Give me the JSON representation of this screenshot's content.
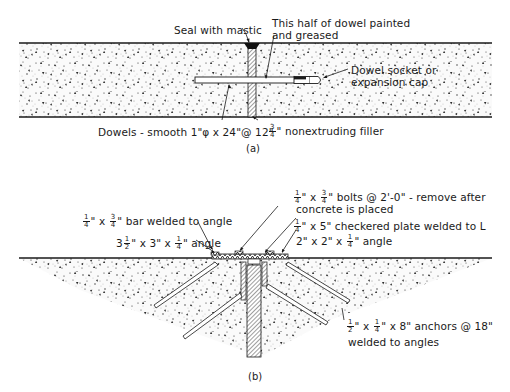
{
  "figure_a": {
    "caption": "(a)",
    "labels": {
      "seal": "Seal with mastic",
      "dowel_painted_1": "This half of dowel painted",
      "dowel_painted_2": "and greased",
      "socket_1": "Dowel socket or",
      "socket_2": "expansion cap",
      "dowels": "Dowels - smooth 1\"φ x 24\"@ 12\"",
      "filler_frac_n": "3",
      "filler_frac_d": "4",
      "filler": "\" nonextruding filler"
    }
  },
  "figure_b": {
    "caption": "(b)",
    "labels": {
      "bolts_frac1_n": "1",
      "bolts_frac1_d": "4",
      "bolts_mid": "\" x",
      "bolts_frac2_n": "3",
      "bolts_frac2_d": "4",
      "bolts_tail": "\" bolts @ 2'-0\" - remove after",
      "bolts_2": "concrete is placed",
      "plate_frac_n": "1",
      "plate_frac_d": "4",
      "plate": "\" x 5\" checkered plate welded to L",
      "angle2_pre": "2\" x 2\" x",
      "angle2_frac_n": "1",
      "angle2_frac_d": "4",
      "angle2_post": "\" angle",
      "bar_frac1_n": "1",
      "bar_frac1_d": "4",
      "bar_mid": "\" x",
      "bar_frac2_n": "3",
      "bar_frac2_d": "4",
      "bar_tail": "\" bar welded to angle",
      "angle35_pre": "3",
      "angle35_frac_n": "1",
      "angle35_frac_d": "2",
      "angle35_mid": "\" x 3\" x",
      "angle35_frac2_n": "1",
      "angle35_frac2_d": "4",
      "angle35_post": "\" angle",
      "anchors_frac1_n": "1",
      "anchors_frac1_d": "2",
      "anchors_mid": "\" x",
      "anchors_frac2_n": "1",
      "anchors_frac2_d": "4",
      "anchors_tail": "\" x 8\" anchors @ 18\"",
      "anchors_2": "welded to angles"
    }
  },
  "colors": {
    "ink": "#1a1a1a",
    "paper": "#ffffff"
  }
}
